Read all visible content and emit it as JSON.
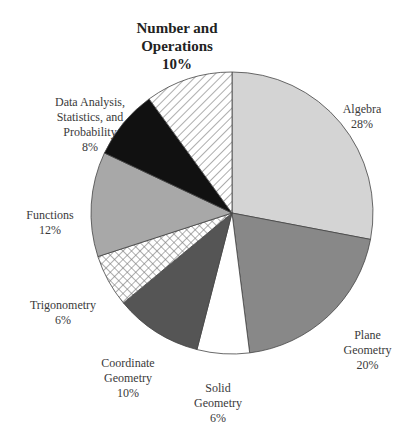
{
  "chart_data": {
    "type": "pie",
    "title": "",
    "start_angle_deg": 0,
    "direction": "clockwise",
    "slices": [
      {
        "key": "algebra",
        "label": "Algebra",
        "value": 28,
        "fill": "#d4d4d4",
        "pattern": "none"
      },
      {
        "key": "plane_geometry",
        "label": "Plane Geometry",
        "value": 20,
        "fill": "#888888",
        "pattern": "none"
      },
      {
        "key": "solid_geometry",
        "label": "Solid Geometry",
        "value": 6,
        "fill": "#ffffff",
        "pattern": "none"
      },
      {
        "key": "coordinate_geometry",
        "label": "Coordinate Geometry",
        "value": 10,
        "fill": "#555555",
        "pattern": "none"
      },
      {
        "key": "trigonometry",
        "label": "Trigonometry",
        "value": 6,
        "fill": "#ffffff",
        "pattern": "crosshatch"
      },
      {
        "key": "functions",
        "label": "Functions",
        "value": 12,
        "fill": "#a8a8a8",
        "pattern": "none"
      },
      {
        "key": "data_analysis",
        "label": "Data Analysis, Statistics, and Probability",
        "value": 8,
        "fill": "#111111",
        "pattern": "none"
      },
      {
        "key": "number_operations",
        "label": "Number and Operations",
        "value": 10,
        "fill": "#ffffff",
        "pattern": "diagonal-stripes",
        "emphasized": true
      }
    ],
    "categories": [
      "Algebra",
      "Plane Geometry",
      "Solid Geometry",
      "Coordinate Geometry",
      "Trigonometry",
      "Functions",
      "Data Analysis, Statistics, and Probability",
      "Number and Operations"
    ],
    "values": [
      28,
      20,
      6,
      10,
      6,
      12,
      8,
      10
    ],
    "unit": "%"
  },
  "labels": {
    "number_operations": {
      "name": "Number and\nOperations",
      "pct": "10%"
    },
    "algebra": {
      "name": "Algebra",
      "pct": "28%"
    },
    "data_analysis": {
      "name": "Data Analysis,\nStatistics, and\nProbability",
      "pct": "8%"
    },
    "functions": {
      "name": "Functions",
      "pct": "12%"
    },
    "trigonometry": {
      "name": "Trigonometry",
      "pct": "6%"
    },
    "coordinate_geometry": {
      "name": "Coordinate\nGeometry",
      "pct": "10%"
    },
    "solid_geometry": {
      "name": "Solid\nGeometry",
      "pct": "6%"
    },
    "plane_geometry": {
      "name": "Plane\nGeometry",
      "pct": "20%"
    }
  }
}
